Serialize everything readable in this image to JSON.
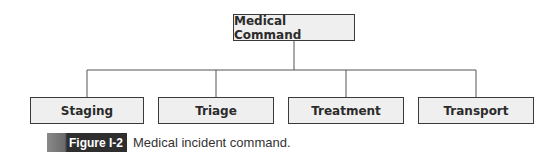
{
  "diagram": {
    "root": {
      "label": "Medical Command"
    },
    "children": [
      {
        "label": "Staging"
      },
      {
        "label": "Triage"
      },
      {
        "label": "Treatment"
      },
      {
        "label": "Transport"
      }
    ],
    "colors": {
      "box_fill": "#efefef",
      "box_border": "#3a3a3a",
      "connector": "#555555",
      "label_bg": "#2e2e2e"
    }
  },
  "caption": {
    "figure_label": "Figure I-2",
    "text": "Medical incident command."
  }
}
